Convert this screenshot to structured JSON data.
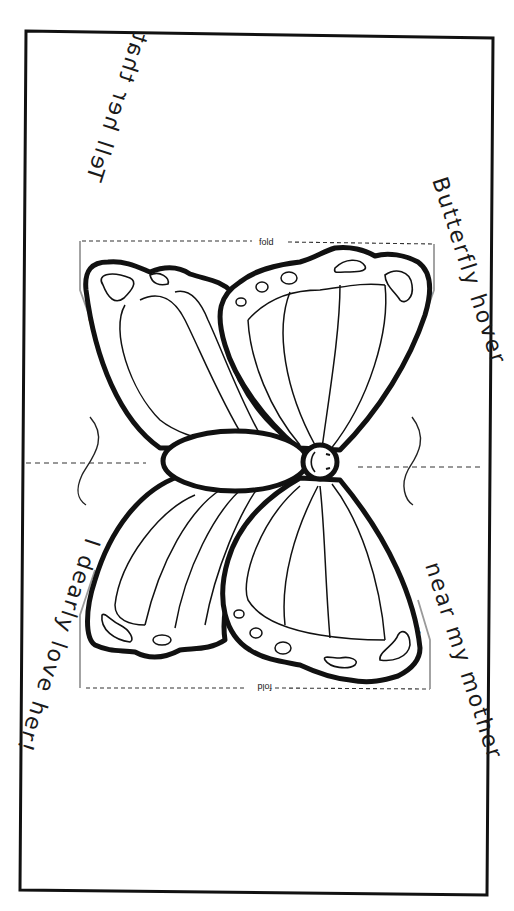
{
  "page": {
    "type": "printable-craft-template"
  },
  "verses": {
    "top_right": "Butterfly hover",
    "bottom_right": "near my mother",
    "top_left": "Tell her that",
    "bottom_left": "I dearly love her!"
  },
  "guides": {
    "fold_top": "fold",
    "fold_bottom": "fold",
    "cut_top_left": "cut",
    "cut_top_right": "cut",
    "cut_bottom_left": "cut",
    "cut_bottom_right": "cut"
  },
  "colors": {
    "ink": "#111111",
    "guide": "#999999",
    "paper": "#ffffff"
  }
}
